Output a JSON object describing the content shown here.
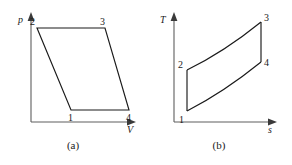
{
  "figure": {
    "panels": [
      {
        "id": "a",
        "caption": "(a)",
        "y_axis_label": "p",
        "x_axis_label": "V",
        "state_points": [
          {
            "label": "1",
            "x": 0.455,
            "y": 0.115
          },
          {
            "label": "2",
            "x": 0.115,
            "y": 0.865
          },
          {
            "label": "3",
            "x": 0.585,
            "y": 0.865
          },
          {
            "label": "4",
            "x": 0.955,
            "y": 0.115
          }
        ],
        "processes": [
          {
            "from": "1",
            "to": "2",
            "shape": "straight"
          },
          {
            "from": "2",
            "to": "3",
            "shape": "straight"
          },
          {
            "from": "3",
            "to": "4",
            "shape": "straight"
          },
          {
            "from": "4",
            "to": "1",
            "shape": "straight"
          }
        ]
      },
      {
        "id": "b",
        "caption": "(b)",
        "y_axis_label": "T",
        "x_axis_label": "s",
        "state_points": [
          {
            "label": "1",
            "x": 0.145,
            "y": 0.08
          },
          {
            "label": "2",
            "x": 0.145,
            "y": 0.42
          },
          {
            "label": "3",
            "x": 0.89,
            "y": 0.93
          },
          {
            "label": "4",
            "x": 0.89,
            "y": 0.59
          }
        ],
        "processes": [
          {
            "from": "1",
            "to": "2",
            "shape": "straight"
          },
          {
            "from": "2",
            "to": "3",
            "shape": "curved"
          },
          {
            "from": "3",
            "to": "4",
            "shape": "straight"
          },
          {
            "from": "4",
            "to": "1",
            "shape": "curved"
          }
        ]
      }
    ]
  },
  "colors": {
    "cycle_stroke": "#1a1a1a",
    "axis_stroke": "#5e5e5e",
    "background": "#ffffff",
    "text": "#1a1a1a"
  }
}
